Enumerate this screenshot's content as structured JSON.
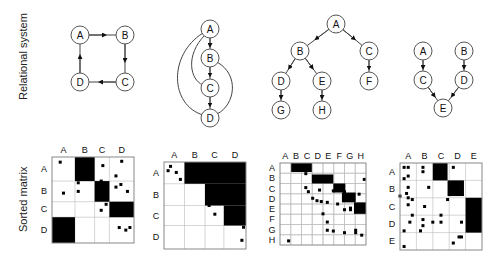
{
  "row_labels": {
    "top": "Relational system",
    "bottom": "Sorted matrix"
  },
  "panels": [
    {
      "name": "ring",
      "nodes": [
        {
          "id": "A",
          "x": 80,
          "y": 35
        },
        {
          "id": "B",
          "x": 125,
          "y": 35
        },
        {
          "id": "C",
          "x": 125,
          "y": 82
        },
        {
          "id": "D",
          "x": 80,
          "y": 82
        }
      ],
      "edges": [
        [
          "A",
          "B"
        ],
        [
          "B",
          "C"
        ],
        [
          "C",
          "D"
        ],
        [
          "D",
          "A"
        ]
      ],
      "matrix": {
        "x": 52,
        "y": 157,
        "w": 82,
        "h": 86,
        "labels": [
          "A",
          "B",
          "C",
          "D"
        ],
        "bounds": [
          0,
          0.28,
          0.52,
          0.7,
          1
        ],
        "blocks": [
          {
            "r": [
              0,
              0.28
            ],
            "c": [
              0.28,
              0.52
            ]
          },
          {
            "r": [
              0.28,
              0.52
            ],
            "c": [
              0.52,
              0.7
            ]
          },
          {
            "r": [
              0.52,
              0.7
            ],
            "c": [
              0.7,
              1
            ]
          },
          {
            "r": [
              0.7,
              1
            ],
            "c": [
              0,
              0.28
            ]
          }
        ],
        "dots": [
          [
            0.1,
            0.06
          ],
          [
            0.14,
            0.42
          ],
          [
            0.62,
            0.1
          ],
          [
            0.85,
            0.05
          ],
          [
            0.78,
            0.22
          ],
          [
            0.32,
            0.12
          ],
          [
            0.32,
            0.3
          ],
          [
            0.32,
            0.4
          ],
          [
            0.42,
            0.2
          ],
          [
            0.6,
            0.28
          ],
          [
            0.58,
            0.4
          ],
          [
            0.6,
            0.62
          ],
          [
            0.66,
            0.55
          ],
          [
            0.78,
            0.35
          ],
          [
            0.78,
            0.55
          ],
          [
            0.84,
            0.32
          ],
          [
            0.92,
            0.4
          ],
          [
            0.9,
            0.85
          ],
          [
            0.95,
            0.82
          ],
          [
            0.82,
            0.82
          ]
        ]
      }
    },
    {
      "name": "transitive",
      "nodes": [
        {
          "id": "A",
          "x": 210,
          "y": 29
        },
        {
          "id": "B",
          "x": 210,
          "y": 58
        },
        {
          "id": "C",
          "x": 210,
          "y": 88
        },
        {
          "id": "D",
          "x": 210,
          "y": 118
        }
      ],
      "edges": [
        [
          "A",
          "B"
        ],
        [
          "B",
          "C"
        ],
        [
          "C",
          "D"
        ]
      ],
      "curves": [
        {
          "d": "M203,33 C168,55 170,105 203,115"
        },
        {
          "d": "M205,35 C185,55 190,80 203,85"
        },
        {
          "d": "M217,62 C240,75 235,105 217,114"
        }
      ],
      "matrix": {
        "x": 164,
        "y": 162,
        "w": 82,
        "h": 87,
        "labels": [
          "A",
          "B",
          "C",
          "D"
        ],
        "bounds": [
          0,
          0.25,
          0.5,
          0.73,
          1
        ],
        "blocks": [
          {
            "r": [
              0,
              0.25
            ],
            "c": [
              0.25,
              1
            ]
          },
          {
            "r": [
              0.25,
              0.5
            ],
            "c": [
              0.5,
              1
            ]
          },
          {
            "r": [
              0.5,
              0.73
            ],
            "c": [
              0.73,
              1
            ]
          }
        ],
        "dots": [
          [
            0.05,
            0.1
          ],
          [
            0.08,
            0.05
          ],
          [
            0.15,
            0.12
          ],
          [
            0.2,
            0.2
          ],
          [
            0.42,
            0.05
          ],
          [
            0.55,
            0.02
          ],
          [
            0.6,
            0.1
          ],
          [
            0.65,
            0.2
          ],
          [
            0.55,
            0.5
          ],
          [
            0.62,
            0.6
          ],
          [
            0.75,
            0.4
          ],
          [
            0.75,
            0.6
          ],
          [
            0.82,
            0.4
          ],
          [
            0.82,
            0.62
          ],
          [
            0.88,
            0.55
          ],
          [
            0.92,
            0.7
          ],
          [
            0.97,
            0.75
          ],
          [
            0.95,
            0.9
          ]
        ]
      }
    },
    {
      "name": "tree",
      "nodes": [
        {
          "id": "A",
          "x": 336,
          "y": 24
        },
        {
          "id": "B",
          "x": 300,
          "y": 51
        },
        {
          "id": "C",
          "x": 369,
          "y": 51
        },
        {
          "id": "D",
          "x": 281,
          "y": 81
        },
        {
          "id": "E",
          "x": 322,
          "y": 81
        },
        {
          "id": "F",
          "x": 369,
          "y": 81
        },
        {
          "id": "G",
          "x": 281,
          "y": 110
        },
        {
          "id": "H",
          "x": 322,
          "y": 110
        }
      ],
      "edges": [
        [
          "A",
          "B"
        ],
        [
          "A",
          "C"
        ],
        [
          "B",
          "D"
        ],
        [
          "B",
          "E"
        ],
        [
          "C",
          "F"
        ],
        [
          "D",
          "G"
        ],
        [
          "E",
          "H"
        ]
      ],
      "matrix": {
        "x": 280,
        "y": 163,
        "w": 86,
        "h": 82,
        "labels": [
          "A",
          "B",
          "C",
          "D",
          "E",
          "F",
          "G",
          "H"
        ],
        "bounds": [
          0,
          0.125,
          0.25,
          0.375,
          0.5,
          0.625,
          0.75,
          0.875,
          1
        ],
        "blocks": [
          {
            "r": [
              0,
              0.11
            ],
            "c": [
              0.13,
              0.37
            ]
          },
          {
            "r": [
              0.14,
              0.25
            ],
            "c": [
              0.37,
              0.62
            ]
          },
          {
            "r": [
              0.25,
              0.36
            ],
            "c": [
              0.62,
              0.76
            ]
          },
          {
            "r": [
              0.36,
              0.48
            ],
            "c": [
              0.72,
              0.88
            ]
          },
          {
            "r": [
              0.48,
              0.62
            ],
            "c": [
              0.86,
              1
            ]
          }
        ],
        "dots": [
          [
            0.2,
            0.05
          ],
          [
            0.3,
            0.04
          ],
          [
            0.3,
            0.13
          ],
          [
            0.3,
            0.3
          ],
          [
            0.33,
            0.35
          ],
          [
            0.38,
            0.43
          ],
          [
            0.43,
            0.46
          ],
          [
            0.46,
            0.33
          ],
          [
            0.48,
            0.47
          ],
          [
            0.55,
            0.48
          ],
          [
            0.62,
            0.34
          ],
          [
            0.67,
            0.5
          ],
          [
            0.75,
            0.35
          ],
          [
            0.75,
            0.57
          ],
          [
            0.8,
            0.43
          ],
          [
            0.82,
            0.45
          ],
          [
            0.82,
            0.55
          ],
          [
            0.82,
            0.57
          ],
          [
            0.88,
            0.82
          ],
          [
            0.92,
            0.38
          ],
          [
            0.5,
            0.62
          ],
          [
            0.55,
            0.72
          ],
          [
            0.55,
            0.82
          ],
          [
            0.62,
            0.83
          ],
          [
            0.75,
            0.85
          ],
          [
            0.88,
            0.85
          ],
          [
            0.95,
            0.88
          ],
          [
            0.1,
            0.95
          ],
          [
            0.98,
            0.2
          ]
        ]
      }
    },
    {
      "name": "converge",
      "nodes": [
        {
          "id": "A",
          "x": 423,
          "y": 51
        },
        {
          "id": "B",
          "x": 464,
          "y": 51
        },
        {
          "id": "C",
          "x": 423,
          "y": 80
        },
        {
          "id": "D",
          "x": 464,
          "y": 80
        },
        {
          "id": "E",
          "x": 443,
          "y": 108
        }
      ],
      "edges": [
        [
          "A",
          "C"
        ],
        [
          "B",
          "D"
        ],
        [
          "C",
          "E"
        ],
        [
          "D",
          "E"
        ]
      ],
      "matrix": {
        "x": 400,
        "y": 163,
        "w": 82,
        "h": 87,
        "labels": [
          "A",
          "B",
          "C",
          "D",
          "E"
        ],
        "bounds": [
          0,
          0.2,
          0.4,
          0.6,
          0.8,
          1
        ],
        "blocks": [
          {
            "r": [
              0,
              0.2
            ],
            "c": [
              0.4,
              0.58
            ]
          },
          {
            "r": [
              0.2,
              0.38
            ],
            "c": [
              0.58,
              0.78
            ]
          },
          {
            "r": [
              0.4,
              0.8
            ],
            "c": [
              0.8,
              1
            ]
          }
        ],
        "dots": [
          [
            0.05,
            0.05
          ],
          [
            0.1,
            0.05
          ],
          [
            0.1,
            0.15
          ],
          [
            0.05,
            0.18
          ],
          [
            0.1,
            0.28
          ],
          [
            0.08,
            0.35
          ],
          [
            0.1,
            0.4
          ],
          [
            0.1,
            0.48
          ],
          [
            0.15,
            0.42
          ],
          [
            0.15,
            0.6
          ],
          [
            0.12,
            0.68
          ],
          [
            0.05,
            0.78
          ],
          [
            0.05,
            0.96
          ],
          [
            0.28,
            0.05
          ],
          [
            0.28,
            0.1
          ],
          [
            0.35,
            0.28
          ],
          [
            0.3,
            0.5
          ],
          [
            0.28,
            0.65
          ],
          [
            0.28,
            0.72
          ],
          [
            0.25,
            0.78
          ],
          [
            0.4,
            0.68
          ],
          [
            0.5,
            0.6
          ],
          [
            0.5,
            0.68
          ],
          [
            0.65,
            0.05
          ],
          [
            0.58,
            0.42
          ],
          [
            0.75,
            0.68
          ],
          [
            0.72,
            0.85
          ],
          [
            0.75,
            0.85
          ],
          [
            0.65,
            0.92
          ],
          [
            0.0,
            0.38
          ]
        ]
      }
    }
  ]
}
